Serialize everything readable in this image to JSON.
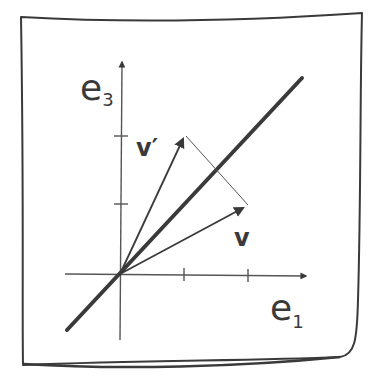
{
  "diagram": {
    "style": "hand-drawn sketch",
    "colors": {
      "background": "#ffffff",
      "ink": "#3a3a3a",
      "ink_light": "#555555"
    },
    "axes": {
      "horizontal": {
        "label_main": "e",
        "label_sub": "1"
      },
      "vertical": {
        "label_main": "e",
        "label_sub": "3"
      }
    },
    "vectors": [
      {
        "name": "v",
        "label": "v"
      },
      {
        "name": "v_prime",
        "label": "v′"
      }
    ],
    "reflection_line": {
      "description": "thick diagonal line through origin"
    },
    "connector": {
      "description": "thin line from tip of v′ to tip of v"
    }
  }
}
